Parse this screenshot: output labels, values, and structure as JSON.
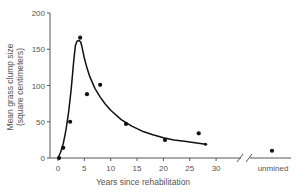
{
  "chart_data": {
    "type": "scatter",
    "title": "",
    "xlabel": "Years since rehabilitation",
    "ylabel_lines": [
      "Mean grass clump size",
      "(square centimeters)"
    ],
    "ylabel": "Mean grass clump size (square centimeters)",
    "xlim": [
      0,
      30
    ],
    "ylim": [
      0,
      200
    ],
    "x_ticks": [
      0,
      5,
      10,
      15,
      20,
      25,
      30
    ],
    "y_ticks": [
      0,
      50,
      100,
      150,
      200
    ],
    "extra_x_category": "unmined",
    "axis_break": true,
    "grid": false,
    "legend": null,
    "series": [
      {
        "name": "observed",
        "kind": "points",
        "x": [
          0.2,
          1.0,
          2.3,
          4.2,
          5.5,
          8.0,
          12.9,
          20.3,
          26.7
        ],
        "y": [
          0,
          14,
          50,
          166,
          88,
          101,
          47,
          25,
          34
        ]
      },
      {
        "name": "unmined",
        "kind": "points",
        "x": [
          "unmined"
        ],
        "y": [
          10
        ]
      },
      {
        "name": "fitted curve",
        "kind": "line",
        "x": [
          0,
          0.5,
          1,
          1.5,
          2,
          2.5,
          3,
          3.3,
          3.6,
          4.0,
          4.3,
          4.6,
          5,
          5.5,
          6,
          7,
          8,
          9,
          10,
          12,
          14,
          16,
          18,
          20,
          22,
          24,
          26,
          28
        ],
        "y": [
          0,
          8,
          20,
          38,
          62,
          95,
          135,
          155,
          161,
          162,
          160,
          152,
          138,
          124,
          113,
          96,
          84,
          74,
          66,
          53,
          44,
          37,
          32,
          28,
          25,
          23,
          21,
          19
        ]
      }
    ],
    "colors": {
      "axis": "#555555",
      "series": "#111111"
    }
  }
}
